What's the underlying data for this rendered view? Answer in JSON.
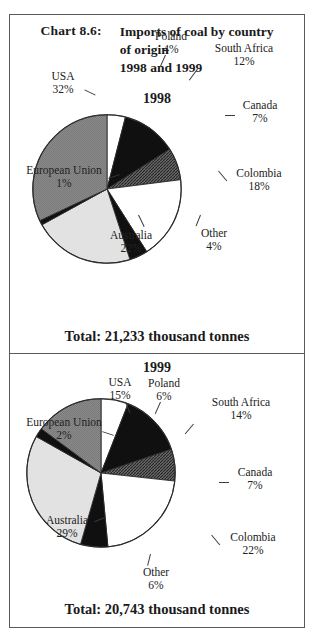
{
  "chart_number": "Chart 8.6:",
  "title_lines": [
    "Imports of coal by country",
    "of origin",
    "1998 and 1999"
  ],
  "panels": [
    {
      "year": "1998",
      "total": "Total: 21,233 thousand tonnes"
    },
    {
      "year": "1999",
      "total": "Total: 20,743 thousand tonnes"
    }
  ],
  "labels": {
    "poland": "Poland",
    "south_africa": "South Africa",
    "canada": "Canada",
    "colombia": "Colombia",
    "other": "Other",
    "australia": "Australia",
    "european_union": "European Union",
    "usa": "USA"
  },
  "pct_1998": {
    "poland": "4%",
    "south_africa": "12%",
    "canada": "7%",
    "colombia": "18%",
    "other": "4%",
    "australia": "22%",
    "european_union": "1%",
    "usa": "32%"
  },
  "pct_1999": {
    "poland": "6%",
    "south_africa": "14%",
    "canada": "7%",
    "colombia": "22%",
    "other": "6%",
    "australia": "29%",
    "european_union": "2%",
    "usa": "15%"
  },
  "colors": {
    "white": "#ffffff",
    "black": "#101010",
    "hatch_dark": "#555555",
    "light_gray": "#e2e2e2",
    "medium_gray": "#848484",
    "outline": "#2b2b2b",
    "frame": "#5a5a5a"
  },
  "chart_data": [
    {
      "type": "pie",
      "title": "1998",
      "subtitle": "Imports of coal by country of origin",
      "total_label": "Total: 21,233 thousand tonnes",
      "total_value": 21233,
      "units": "thousand tonnes",
      "legend": "labelled slices",
      "categories": [
        "Poland",
        "South Africa",
        "Canada",
        "Colombia",
        "Other",
        "Australia",
        "European Union",
        "USA"
      ],
      "values": [
        4,
        12,
        7,
        18,
        4,
        22,
        1,
        32
      ],
      "value_labels": [
        "4%",
        "12%",
        "7%",
        "18%",
        "4%",
        "22%",
        "1%",
        "32%"
      ],
      "slice_colors": [
        "#ffffff",
        "#101010",
        "#555555",
        "#ffffff",
        "#101010",
        "#e2e2e2",
        "#101010",
        "#848484"
      ],
      "start_angle_deg": 0,
      "direction": "clockwise"
    },
    {
      "type": "pie",
      "title": "1999",
      "subtitle": "Imports of coal by country of origin",
      "total_label": "Total: 20,743 thousand tonnes",
      "total_value": 20743,
      "units": "thousand tonnes",
      "legend": "labelled slices",
      "categories": [
        "Poland",
        "South Africa",
        "Canada",
        "Colombia",
        "Other",
        "Australia",
        "European Union",
        "USA"
      ],
      "values": [
        6,
        14,
        7,
        22,
        6,
        29,
        2,
        15
      ],
      "value_labels": [
        "6%",
        "14%",
        "7%",
        "22%",
        "6%",
        "29%",
        "2%",
        "15%"
      ],
      "slice_colors": [
        "#ffffff",
        "#101010",
        "#555555",
        "#ffffff",
        "#101010",
        "#e2e2e2",
        "#101010",
        "#848484"
      ],
      "start_angle_deg": 0,
      "direction": "clockwise"
    }
  ]
}
